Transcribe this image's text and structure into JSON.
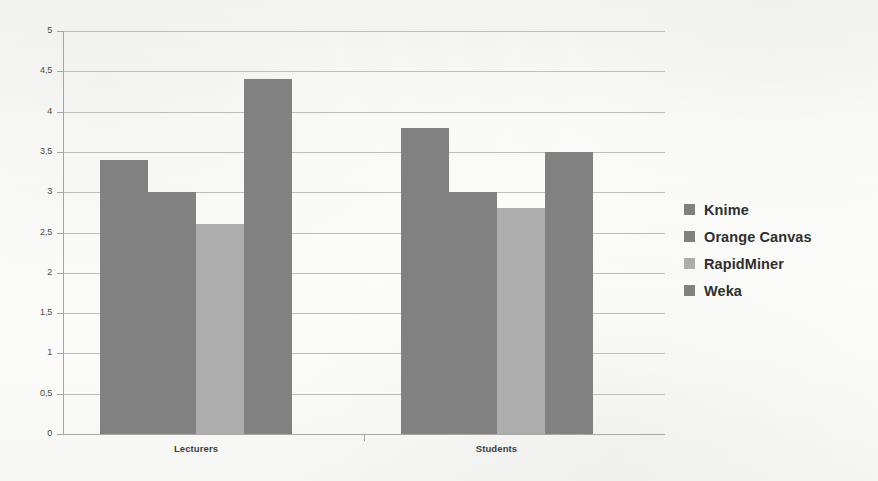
{
  "chart_data": {
    "type": "bar",
    "title": "",
    "subtitle": "",
    "xlabel": "",
    "ylabel": "",
    "categories": [
      "Lecturers",
      "Students"
    ],
    "series": [
      {
        "name": "Knime",
        "values": [
          3.4,
          3.8
        ],
        "color": "#818181"
      },
      {
        "name": "Orange Canvas",
        "values": [
          3.0,
          3.0
        ],
        "color": "#818181"
      },
      {
        "name": "RapidMiner",
        "values": [
          2.6,
          2.8
        ],
        "color": "#adadad"
      },
      {
        "name": "Weka",
        "values": [
          4.4,
          3.5
        ],
        "color": "#818181"
      }
    ],
    "ylim": [
      0,
      5
    ],
    "ytick_values": [
      5,
      4.5,
      4,
      3.5,
      3,
      2.5,
      2,
      1.5,
      1,
      0.5,
      0
    ],
    "ytick_labels": [
      "5",
      "4,5",
      "4",
      "3,5",
      "3",
      "2,5",
      "2",
      "1,5",
      "1",
      "0,5",
      "0"
    ],
    "grid": true,
    "legend_position": "right",
    "decimal_separator": ","
  },
  "legend": {
    "items": [
      {
        "label": "Knime",
        "swatch": "#818181"
      },
      {
        "label": "Orange Canvas",
        "swatch": "#818181"
      },
      {
        "label": "RapidMiner",
        "swatch": "#adadad"
      },
      {
        "label": "Weka",
        "swatch": "#818181"
      }
    ]
  },
  "axes": {
    "x_labels": [
      "Lecturers",
      "Students"
    ],
    "y_labels": [
      "5",
      "4,5",
      "4",
      "3,5",
      "3",
      "2,5",
      "2",
      "1,5",
      "1",
      "0,5",
      "0"
    ]
  },
  "background_artifacts": {
    "ghost_text_top_left": "a scanned page of faded text",
    "ghost_text_top_right": "bleed-through from the reverse side"
  }
}
